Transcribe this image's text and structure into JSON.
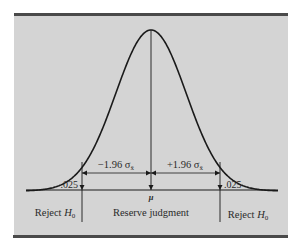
{
  "figure": {
    "panel_color": "#d4d4d4",
    "rule_color": "#4a4a4a",
    "line_color": "#1a1a1a",
    "mean_label": "μ",
    "left_interval_label": "−1.96 σ",
    "right_interval_label": "+1.96 σ",
    "sigma_subscript": "x̄",
    "left_tail_label": ".025",
    "right_tail_label": ".025",
    "regions": {
      "left": {
        "text": "Reject ",
        "h": "H",
        "sub": "0"
      },
      "center": {
        "text": "Reserve judgment"
      },
      "right": {
        "text": "Reject ",
        "h": "H",
        "sub": "0"
      }
    },
    "distribution": {
      "type": "normal",
      "critical_z": 1.96,
      "tail_probability": 0.025
    }
  }
}
